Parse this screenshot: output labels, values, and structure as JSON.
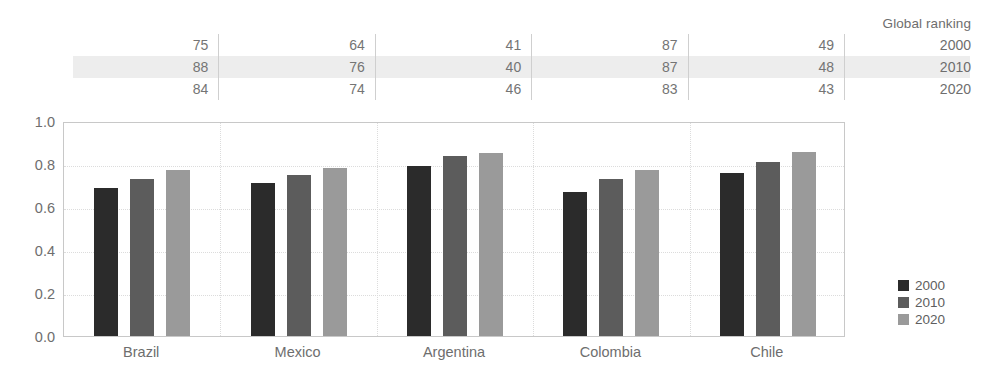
{
  "table": {
    "header_label": "Global ranking",
    "row_years": [
      "2000",
      "2010",
      "2020"
    ],
    "highlight_row_index": 1,
    "values": [
      [
        "75",
        "64",
        "41",
        "87",
        "49"
      ],
      [
        "88",
        "76",
        "40",
        "87",
        "48"
      ],
      [
        "84",
        "74",
        "46",
        "83",
        "43"
      ]
    ]
  },
  "legend": {
    "entries": [
      {
        "label": "2000",
        "color": "#2b2b2b"
      },
      {
        "label": "2010",
        "color": "#5c5c5c"
      },
      {
        "label": "2020",
        "color": "#9a9a9a"
      }
    ]
  },
  "chart_data": {
    "type": "bar",
    "title": "",
    "xlabel": "",
    "ylabel": "",
    "categories": [
      "Brazil",
      "Mexico",
      "Argentina",
      "Colombia",
      "Chile"
    ],
    "series": [
      {
        "name": "2000",
        "color": "#2b2b2b",
        "values": [
          0.69,
          0.71,
          0.79,
          0.67,
          0.76
        ]
      },
      {
        "name": "2010",
        "color": "#5c5c5c",
        "values": [
          0.73,
          0.75,
          0.835,
          0.73,
          0.81
        ]
      },
      {
        "name": "2020",
        "color": "#9a9a9a",
        "values": [
          0.77,
          0.78,
          0.85,
          0.77,
          0.855
        ]
      }
    ],
    "ylim": [
      0.0,
      1.0
    ],
    "yticks": [
      "1.0",
      "0.8",
      "0.6",
      "0.4",
      "0.2",
      "0.0"
    ],
    "ytick_values": [
      1.0,
      0.8,
      0.6,
      0.4,
      0.2,
      0.0
    ],
    "grid": true,
    "legend_position": "right"
  }
}
